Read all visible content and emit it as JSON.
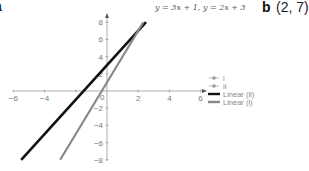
{
  "labels": {
    "part_a": "a",
    "part_b": "b",
    "answer_b": "(2, 7)"
  },
  "chart_data": {
    "type": "line",
    "title": "y = 3x + 1, y = 2x + 3",
    "xlabel": "",
    "ylabel": "",
    "xlim": [
      -6,
      6.5
    ],
    "ylim": [
      -8,
      8.5
    ],
    "x_ticks": [
      -6,
      -4,
      -2,
      0,
      2,
      4,
      6
    ],
    "y_ticks": [
      -8,
      -6,
      -4,
      -2,
      0,
      2,
      4,
      6,
      8
    ],
    "x_tick_labels": [
      "−6",
      "−4",
      "",
      "0",
      "2",
      "4",
      "6"
    ],
    "y_tick_labels": [
      "−8",
      "−6",
      "−4",
      "−2",
      "",
      "2",
      "4",
      "6",
      "8"
    ],
    "grid": false,
    "legend_position": "right",
    "series": [
      {
        "name": "Linear (ii)",
        "equation": "y = 2x + 3",
        "x": [
          -5.5,
          2.5
        ],
        "y": [
          -8,
          8
        ],
        "color": "#111111"
      },
      {
        "name": "Linear (i)",
        "equation": "y = 3x + 1",
        "x": [
          -3,
          2.33
        ],
        "y": [
          -8,
          8
        ],
        "color": "#888888"
      }
    ],
    "legend": [
      {
        "label": "i",
        "style": "marker-line",
        "color": "#aaaaaa"
      },
      {
        "label": "ii",
        "style": "marker-line",
        "color": "#aaaaaa"
      },
      {
        "label": "Linear (ii)",
        "style": "line",
        "color": "#111111"
      },
      {
        "label": "Linear (i)",
        "style": "line",
        "color": "#888888"
      }
    ],
    "intersection": {
      "x": 2,
      "y": 7
    }
  }
}
